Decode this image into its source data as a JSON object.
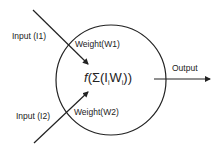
{
  "diagram": {
    "nodes": [
      {
        "id": "neuron",
        "shape": "circle",
        "label": "f(Σ(IiWi))",
        "formula": {
          "func": "f",
          "open": "(Σ(I",
          "sub1": "i",
          "mid": "W",
          "sub2": "i",
          "close": "))"
        }
      }
    ],
    "inputs": [
      {
        "label": "Input (I1)",
        "weight": "Weight(W1)"
      },
      {
        "label": "Input (I2)",
        "weight": "Weight(W2)"
      }
    ],
    "output": {
      "label": "Output"
    },
    "edges": [
      {
        "from": "Input (I1)",
        "to": "neuron"
      },
      {
        "from": "Input (I2)",
        "to": "neuron"
      },
      {
        "from": "neuron",
        "to": "Output"
      }
    ],
    "colors": {
      "stroke": "#222222",
      "background": "#ffffff"
    }
  }
}
